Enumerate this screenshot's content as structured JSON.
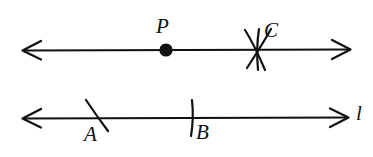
{
  "figure": {
    "background_color": "#ffffff",
    "ink_color": "#111111",
    "width": 373,
    "height": 157
  },
  "lines": [
    {
      "id": "top-line",
      "name": "upper-line",
      "label": "",
      "y": 50,
      "x_start": 22,
      "x_end": 350,
      "arrow_start": true,
      "arrow_end": true
    },
    {
      "id": "bottom-line",
      "name": "line-l",
      "label": "l",
      "y": 118,
      "x_start": 22,
      "x_end": 348,
      "arrow_start": true,
      "arrow_end": true
    }
  ],
  "points": [
    {
      "label": "P",
      "line": "top-line",
      "x": 166,
      "y": 50,
      "mark": "dot",
      "label_x": 156,
      "label_y": 16
    },
    {
      "label": "C",
      "line": "top-line",
      "x": 257,
      "y": 50,
      "mark": "arc-cross",
      "label_x": 264,
      "label_y": 20
    },
    {
      "label": "A",
      "line": "bottom-line",
      "x": 97,
      "y": 118,
      "mark": "slanted-tick",
      "label_x": 84,
      "label_y": 124
    },
    {
      "label": "B",
      "line": "bottom-line",
      "x": 193,
      "y": 118,
      "mark": "vertical-tick",
      "label_x": 196,
      "label_y": 122
    }
  ],
  "labels": {
    "point_p": "P",
    "point_c": "C",
    "point_a": "A",
    "point_b": "B",
    "line_l": "l"
  }
}
